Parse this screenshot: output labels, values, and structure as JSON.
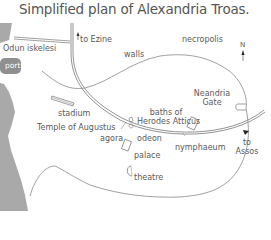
{
  "title": "Simplified plan of Alexandria Troas.",
  "colors": {
    "water": "#a9a9a9",
    "port": "#8f8f8f",
    "line": "#777777",
    "text": "#5a5a5a"
  },
  "compass": {
    "label": "N"
  },
  "labels": {
    "odun_iskelesi": "Odun iskelesi",
    "port": "port",
    "to_ezine": "to Ezine",
    "walls": "walls",
    "necropolis": "necropolis",
    "stadium": "stadium",
    "temple_of_augustus": "Temple of Augustus",
    "agora": "agora",
    "odeon": "odeon",
    "baths_line1": "baths of",
    "baths_line2": "Herodes Atticus",
    "neandria_line1": "Neandria",
    "neandria_line2": "Gate",
    "nymphaeum": "nymphaeum",
    "to_assos_line1": "to",
    "to_assos_line2": "Assos",
    "palace": "palace",
    "theatre": "theatre"
  }
}
